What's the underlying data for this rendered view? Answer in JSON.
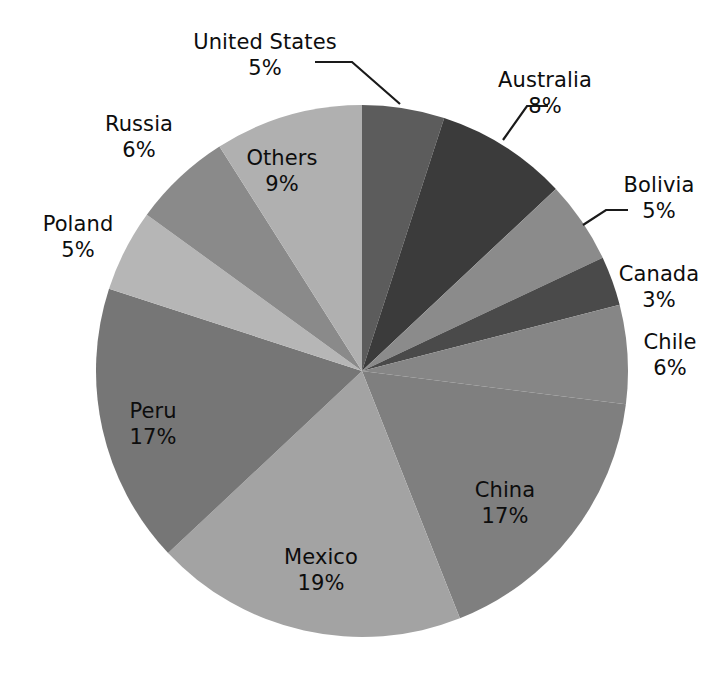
{
  "chart_data": {
    "type": "pie",
    "title": "",
    "unit": "%",
    "legend_position": "none",
    "start_angle_deg": 0,
    "direction": "clockwise",
    "categories": [
      "United States",
      "Australia",
      "Bolivia",
      "Canada",
      "Chile",
      "China",
      "Mexico",
      "Peru",
      "Poland",
      "Russia",
      "Others"
    ],
    "values": [
      5,
      8,
      5,
      3,
      6,
      17,
      19,
      17,
      5,
      6,
      9
    ],
    "labels": [
      "5%",
      "8%",
      "5%",
      "3%",
      "6%",
      "17%",
      "19%",
      "17%",
      "5%",
      "6%",
      "9%"
    ],
    "colors": [
      "#5c5c5c",
      "#3b3b3b",
      "#8b8b8b",
      "#4a4a4a",
      "#868686",
      "#7f7f7f",
      "#a3a3a3",
      "#767676",
      "#b6b6b6",
      "#8a8a8a",
      "#b0b0b0"
    ],
    "slices": [
      {
        "name": "United States",
        "value": 5,
        "label": "5%",
        "color": "#5c5c5c",
        "label_style": "callout"
      },
      {
        "name": "Australia",
        "value": 8,
        "label": "8%",
        "color": "#3b3b3b",
        "label_style": "callout"
      },
      {
        "name": "Bolivia",
        "value": 5,
        "label": "5%",
        "color": "#8b8b8b",
        "label_style": "callout"
      },
      {
        "name": "Canada",
        "value": 3,
        "label": "3%",
        "color": "#4a4a4a",
        "label_style": "outside"
      },
      {
        "name": "Chile",
        "value": 6,
        "label": "6%",
        "color": "#868686",
        "label_style": "outside"
      },
      {
        "name": "China",
        "value": 17,
        "label": "17%",
        "color": "#7f7f7f",
        "label_style": "inside"
      },
      {
        "name": "Mexico",
        "value": 19,
        "label": "19%",
        "color": "#a3a3a3",
        "label_style": "inside"
      },
      {
        "name": "Peru",
        "value": 17,
        "label": "17%",
        "color": "#767676",
        "label_style": "inside"
      },
      {
        "name": "Poland",
        "value": 5,
        "label": "5%",
        "color": "#b6b6b6",
        "label_style": "outside"
      },
      {
        "name": "Russia",
        "value": 6,
        "label": "6%",
        "color": "#8a8a8a",
        "label_style": "outside"
      },
      {
        "name": "Others",
        "value": 9,
        "label": "9%",
        "color": "#b0b0b0",
        "label_style": "inside"
      }
    ]
  },
  "geometry": {
    "center_x": 362,
    "center_y": 371,
    "radius": 266
  },
  "labels": {
    "united_states": {
      "name": "United States",
      "pct": "5%",
      "x": 170,
      "y": 30,
      "align": "center",
      "width": 190
    },
    "australia": {
      "name": "Australia",
      "pct": "8%",
      "x": 480,
      "y": 68,
      "align": "center",
      "width": 130
    },
    "bolivia": {
      "name": "Bolivia",
      "pct": "5%",
      "x": 604,
      "y": 173,
      "align": "center",
      "width": 110
    },
    "canada": {
      "name": "Canada",
      "pct": "3%",
      "x": 600,
      "y": 262,
      "align": "center",
      "width": 118
    },
    "chile": {
      "name": "Chile",
      "pct": "6%",
      "x": 620,
      "y": 330,
      "align": "center",
      "width": 100
    },
    "china": {
      "name": "China",
      "pct": "17%",
      "x": 450,
      "y": 478,
      "align": "center",
      "width": 110
    },
    "mexico": {
      "name": "Mexico",
      "pct": "19%",
      "x": 256,
      "y": 545,
      "align": "center",
      "width": 130
    },
    "peru": {
      "name": "Peru",
      "pct": "17%",
      "x": 98,
      "y": 399,
      "align": "center",
      "width": 110
    },
    "poland": {
      "name": "Poland",
      "pct": "5%",
      "x": 18,
      "y": 212,
      "align": "center",
      "width": 120
    },
    "russia": {
      "name": "Russia",
      "pct": "6%",
      "x": 78,
      "y": 112,
      "align": "center",
      "width": 122
    },
    "others": {
      "name": "Others",
      "pct": "9%",
      "x": 220,
      "y": 146,
      "align": "center",
      "width": 124
    }
  },
  "leaders": {
    "united_states": "M 315 62 L 352 62 L 400 104",
    "australia": "M 503 140 L 527 106 L 548 106",
    "bolivia": "M 583 225 L 606 210 L 628 210"
  },
  "style": {
    "background": "#ffffff",
    "text_color": "#0d0d0d",
    "leader_color": "#1a1a1a"
  }
}
